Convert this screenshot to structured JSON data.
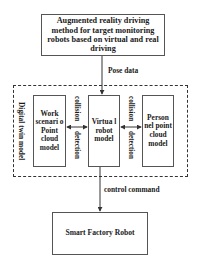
{
  "diagram": {
    "top_box": {
      "label": "Augmented reality driving method for target monitoring robots based on virtual and real driving"
    },
    "pose_edge": {
      "label": "Pose data"
    },
    "digital_twin_group": {
      "label": "Digital twin model",
      "nodes": {
        "work_scenario": {
          "label": "Work scenari o Point cloud model"
        },
        "virtual_robot": {
          "label": "Virtua l robot model"
        },
        "personnel": {
          "label": "Person nel point cloud model"
        }
      },
      "left_edge": {
        "label_top": "collision",
        "label_bottom": "detection"
      },
      "right_edge": {
        "label_top": "collision",
        "label_bottom": "detection"
      }
    },
    "control_edge": {
      "label": "control command"
    },
    "bottom_box": {
      "label": "Smart Factory Robot"
    }
  },
  "colors": {
    "line": "#333333",
    "box_border": "#555555",
    "text": "#1a1a1a",
    "background": "#ffffff"
  }
}
